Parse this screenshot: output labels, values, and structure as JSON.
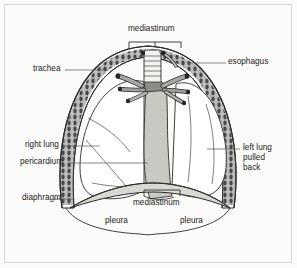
{
  "figure": {
    "background_color": "#fbfbf9",
    "frame_color": "#d6d6d2",
    "ink_color": "#1a1a1a"
  },
  "labels": {
    "mediastinum_top": "mediastinum",
    "trachea": "trachea",
    "esophagus": "esophagus",
    "right_lung": "right lung",
    "pericardium": "pericardium",
    "left_lung_pulled_back": "left lung\npulled\nback",
    "left_lung_line1": "left lung",
    "left_lung_line2": "pulled",
    "left_lung_line3": "back",
    "diaphragm": "diaphragm",
    "mediastinum_bottom": "mediastinum",
    "pleura_left": "pleura",
    "pleura_right": "pleura"
  },
  "anatomy": {
    "chest_wall": "chest-wall-ribs",
    "trachea_structure": "trachea-with-cartilage-rings",
    "bronchi": "bronchi-and-great-vessels",
    "mediastinum_shape": "mediastinum-pericardium-mass",
    "right_lung_shape": "right-lung-with-fissures",
    "left_lung_shape": "left-lung-retracted",
    "diaphragm_shape": "diaphragm-dome",
    "pleura_lines": "pleural-reflection-lines"
  },
  "colors": {
    "outline": "#2b2b2b",
    "rib_fill": "#9a9a9a",
    "rib_dark": "#3a3a3a",
    "mediastinum_fill": "#c9c9c4",
    "lung_fill": "#ffffff",
    "diaphragm_fill": "#d9d9d4",
    "leader_line": "#555555"
  }
}
